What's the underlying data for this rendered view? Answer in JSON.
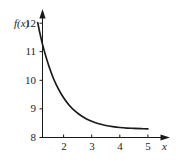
{
  "chart_data": {
    "type": "line",
    "title": "",
    "subtitle": "",
    "xlabel": "x",
    "ylabel": "f(x)",
    "xlim": [
      1.0,
      5.4
    ],
    "ylim": [
      8.0,
      12.3
    ],
    "grid": false,
    "legend": null,
    "x_ticks": [
      {
        "value": 2,
        "label": "2"
      },
      {
        "value": 3,
        "label": "3"
      },
      {
        "value": 4,
        "label": "4"
      },
      {
        "value": 5,
        "label": "5"
      }
    ],
    "y_ticks": [
      {
        "value": 8,
        "label": "8"
      },
      {
        "value": 9,
        "label": "9"
      },
      {
        "value": 10,
        "label": "10"
      },
      {
        "value": 11,
        "label": "11"
      },
      {
        "value": 12,
        "label": "12"
      }
    ],
    "series": [
      {
        "name": "f(x)",
        "color": "#1a1a1a",
        "x": [
          1.08,
          1.15,
          1.25,
          1.35,
          1.5,
          1.65,
          1.8,
          2.0,
          2.2,
          2.4,
          2.6,
          2.8,
          3.0,
          3.25,
          3.5,
          3.75,
          4.0,
          4.25,
          4.5,
          4.75,
          5.0
        ],
        "y": [
          12.02,
          11.68,
          11.26,
          10.9,
          10.43,
          10.04,
          9.73,
          9.39,
          9.13,
          8.93,
          8.78,
          8.66,
          8.57,
          8.48,
          8.42,
          8.38,
          8.35,
          8.33,
          8.32,
          8.31,
          8.3
        ]
      }
    ],
    "axis_arrows": {
      "x": "right",
      "y": "up"
    },
    "accent_color": "#1a1a1a",
    "background_color": "#ffffff"
  }
}
